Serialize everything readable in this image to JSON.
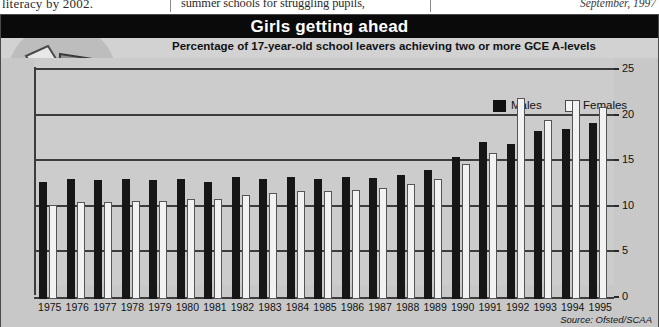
{
  "newsprint": {
    "col1": "literacy by 2002.",
    "col2": "summer schools for struggling pupils,",
    "col3": "September, 1997"
  },
  "graphic": {
    "title": "Girls getting ahead",
    "subtitle": "Percentage of 17-year-old school leavers achieving two or more GCE A-levels",
    "source": "Source: Ofsted/SCAA",
    "illustration_name": "girl-leaping-over-book-illustration",
    "colors": {
      "title_band": "#0a0a0a",
      "panel": "#cccccc",
      "males": "#161616",
      "females": "#f2f2f2",
      "axis": "#3c3c3c"
    }
  },
  "legend": {
    "items": [
      {
        "label": "Males",
        "swatch": "males-swatch"
      },
      {
        "label": "Females",
        "swatch": "females-swatch"
      }
    ]
  },
  "chart_data": {
    "type": "bar",
    "title": "Girls getting ahead",
    "subtitle": "Percentage of 17-year-old school leavers achieving two or more GCE A-levels",
    "xlabel": "",
    "ylabel": "",
    "ylim": [
      0,
      25
    ],
    "yticks": [
      0,
      5,
      10,
      15,
      20,
      25
    ],
    "ytick_labels": [
      "0",
      "5",
      "10",
      "15",
      "20",
      "25"
    ],
    "grid": true,
    "legend_position": "top-right",
    "source": "Source: Ofsted/SCAA",
    "categories": [
      "1975",
      "1976",
      "1977",
      "1978",
      "1979",
      "1980",
      "1981",
      "1982",
      "1983",
      "1984",
      "1985",
      "1986",
      "1987",
      "1988",
      "1989",
      "1990",
      "1991",
      "1992",
      "1993",
      "1994",
      "1995"
    ],
    "series": [
      {
        "name": "Males",
        "color": "#161616",
        "values": [
          12.8,
          13.2,
          13.0,
          13.2,
          13.0,
          13.2,
          12.8,
          13.4,
          13.2,
          13.4,
          13.2,
          13.4,
          13.3,
          13.6,
          14.2,
          15.6,
          17.2,
          17.0,
          18.4,
          18.6,
          19.3
        ]
      },
      {
        "name": "Females",
        "color": "#f2f2f2",
        "values": [
          10.3,
          10.6,
          10.6,
          10.8,
          10.8,
          11.0,
          11.0,
          11.4,
          11.6,
          11.8,
          11.8,
          12.0,
          12.2,
          12.6,
          13.2,
          14.8,
          16.0,
          22.0,
          19.6,
          21.8,
          21.0
        ]
      }
    ]
  }
}
